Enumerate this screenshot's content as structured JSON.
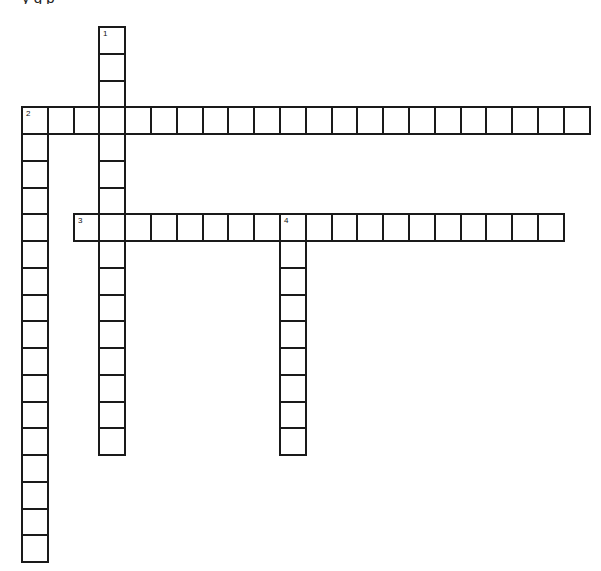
{
  "page": {
    "top_text_fragment": "y                      g                    p"
  },
  "grid": {
    "origin_x": 21,
    "origin_y": 26,
    "cell_w": 25.8,
    "cell_h": 26.75,
    "border_color": "#1a1a1a"
  },
  "words": [
    {
      "number": "1",
      "direction": "down",
      "col": 3,
      "row": 0,
      "length": 16
    },
    {
      "number": "2",
      "direction": "across",
      "col": 0,
      "row": 3,
      "length": 22
    },
    {
      "number": "2",
      "direction": "down",
      "col": 0,
      "row": 3,
      "length": 17
    },
    {
      "number": "3",
      "direction": "across",
      "col": 2,
      "row": 7,
      "length": 19
    },
    {
      "number": "4",
      "direction": "down",
      "col": 10,
      "row": 7,
      "length": 9
    }
  ],
  "clue_numbers": [
    {
      "label": "1",
      "col": 3,
      "row": 0
    },
    {
      "label": "2",
      "col": 0,
      "row": 3
    },
    {
      "label": "3",
      "col": 2,
      "row": 7
    },
    {
      "label": "4",
      "col": 10,
      "row": 7
    }
  ]
}
